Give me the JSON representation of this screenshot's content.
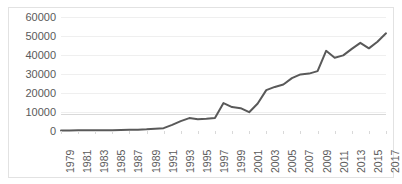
{
  "chart_data": {
    "type": "line",
    "title": "",
    "subtitle": "",
    "xlabel": "",
    "ylabel": "",
    "grid": true,
    "legend": false,
    "legend_position": "none",
    "line_color": "#595959",
    "gridline_color": "#EFEFEF",
    "axis_color": "#D9D9D9",
    "border_color": "#E2E2E2",
    "background_color": "#FFFFFF",
    "tick_label_color": "#5A5A5A",
    "ylim": [
      0,
      60000
    ],
    "ytick_labels": [
      "0",
      "10000",
      "20000",
      "30000",
      "40000",
      "50000",
      "60000"
    ],
    "ytick_values": [
      0,
      10000,
      20000,
      30000,
      40000,
      50000,
      60000
    ],
    "xlim": [
      1979,
      2017
    ],
    "xtick_labels": [
      "1979",
      "1981",
      "1983",
      "1985",
      "1987",
      "1989",
      "1991",
      "1993",
      "1995",
      "1997",
      "1999",
      "2001",
      "2003",
      "2005",
      "2007",
      "2009",
      "2011",
      "2013",
      "2015",
      "2017"
    ],
    "xtick_values": [
      1979,
      1981,
      1983,
      1985,
      1987,
      1989,
      1991,
      1993,
      1995,
      1997,
      1999,
      2001,
      2003,
      2005,
      2007,
      2009,
      2011,
      2013,
      2015,
      2017
    ],
    "x": [
      1979,
      1980,
      1981,
      1982,
      1983,
      1984,
      1985,
      1986,
      1987,
      1988,
      1989,
      1990,
      1991,
      1992,
      1993,
      1994,
      1995,
      1996,
      1997,
      1998,
      1999,
      2000,
      2001,
      2002,
      2003,
      2004,
      2005,
      2006,
      2007,
      2008,
      2009,
      2010,
      2011,
      2012,
      2013,
      2014,
      2015,
      2016,
      2017
    ],
    "values": [
      300,
      320,
      340,
      360,
      380,
      420,
      460,
      520,
      600,
      700,
      900,
      1200,
      1500,
      3200,
      5200,
      6800,
      6200,
      6400,
      6900,
      14700,
      12600,
      12000,
      9900,
      14500,
      21500,
      23200,
      24500,
      27800,
      29800,
      30200,
      31500,
      42200,
      38600,
      39800,
      43200,
      46400,
      43500,
      47000,
      51400
    ],
    "series": [
      {
        "name": "Series 1",
        "values": [
          300,
          320,
          340,
          360,
          380,
          420,
          460,
          520,
          600,
          700,
          900,
          1200,
          1500,
          3200,
          5200,
          6800,
          6200,
          6400,
          6900,
          14700,
          12600,
          12000,
          9900,
          14500,
          21500,
          23200,
          24500,
          27800,
          29800,
          30200,
          31500,
          42200,
          38600,
          39800,
          43200,
          46400,
          43500,
          47000,
          51400
        ]
      }
    ]
  }
}
